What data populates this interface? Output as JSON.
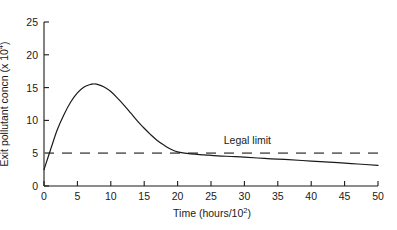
{
  "chart_data": {
    "type": "line",
    "title": "",
    "xlabel": "Time (hours/10",
    "xlabel_exponent": "2",
    "xlabel_suffix": ")",
    "ylabel": "Exit pollutant concn (x 10",
    "ylabel_exponent": "4",
    "ylabel_suffix": ")",
    "xlim": [
      0,
      50
    ],
    "ylim": [
      0,
      25
    ],
    "xticks": [
      0,
      5,
      10,
      15,
      20,
      25,
      30,
      35,
      40,
      45,
      50
    ],
    "xtick_labels": [
      "0",
      "5",
      "10",
      "15",
      "20",
      "25",
      "30",
      "35",
      "40",
      "45",
      "50"
    ],
    "yticks": [
      0,
      5,
      10,
      15,
      20,
      25
    ],
    "ytick_labels": [
      "0",
      "5",
      "10",
      "15",
      "20",
      "25"
    ],
    "grid": false,
    "legend": false,
    "series": [
      {
        "name": "Exit pollutant concentration",
        "style": "solid",
        "color": "#1a1a1a",
        "x": [
          0,
          1,
          2,
          3,
          4,
          5,
          6,
          7,
          7.5,
          8,
          9,
          10,
          11,
          12,
          13,
          14,
          15,
          16,
          17,
          18,
          19,
          20,
          22,
          24,
          26,
          28,
          30,
          33,
          36,
          40,
          44,
          47,
          50
        ],
        "values": [
          2.5,
          5.6,
          8.6,
          10.9,
          12.8,
          14.2,
          15.1,
          15.5,
          15.55,
          15.5,
          15.1,
          14.4,
          13.4,
          12.3,
          11.1,
          9.9,
          8.8,
          7.8,
          6.9,
          6.2,
          5.6,
          5.2,
          4.9,
          4.75,
          4.6,
          4.5,
          4.4,
          4.2,
          4.05,
          3.8,
          3.55,
          3.35,
          3.15
        ]
      },
      {
        "name": "Legal limit",
        "style": "dashed",
        "color": "#6e6e6e",
        "x": [
          0,
          50
        ],
        "values": [
          5,
          5
        ]
      }
    ],
    "annotations": [
      {
        "name": "legal-limit-label",
        "text": "Legal limit",
        "x": 32,
        "y": 6.8
      }
    ]
  },
  "axes": {
    "x_axis_name": "time-axis",
    "y_axis_name": "concentration-axis"
  }
}
